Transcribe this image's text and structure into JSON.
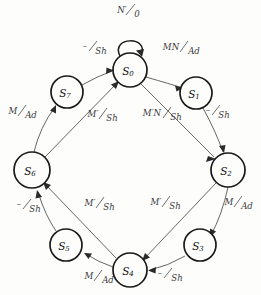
{
  "diagram": {
    "type": "state-transition-diagram",
    "states": [
      {
        "id": "S0",
        "label": "S",
        "subscript": "0",
        "cx": 130,
        "cy": 70,
        "r": 17
      },
      {
        "id": "S1",
        "label": "S",
        "subscript": "1",
        "cx": 196,
        "cy": 93,
        "r": 16
      },
      {
        "id": "S2",
        "label": "S",
        "subscript": "2",
        "cx": 228,
        "cy": 170,
        "r": 17
      },
      {
        "id": "S3",
        "label": "S",
        "subscript": "3",
        "cx": 200,
        "cy": 245,
        "r": 16
      },
      {
        "id": "S4",
        "label": "S",
        "subscript": "4",
        "cx": 130,
        "cy": 270,
        "r": 17
      },
      {
        "id": "S5",
        "label": "S",
        "subscript": "5",
        "cx": 66,
        "cy": 245,
        "r": 16
      },
      {
        "id": "S6",
        "label": "S",
        "subscript": "6",
        "cx": 32,
        "cy": 170,
        "r": 18
      },
      {
        "id": "S7",
        "label": "S",
        "subscript": "7",
        "cx": 67,
        "cy": 92,
        "r": 16
      }
    ],
    "transitions": [
      {
        "id": "t-s0-s0",
        "from": "S0",
        "to": "S0",
        "input": "N′",
        "output": "0",
        "kind": "self-loop",
        "label_x": 127,
        "label_y": 16
      },
      {
        "id": "t-s0-s1",
        "from": "S0",
        "to": "S1",
        "input": "MN",
        "output": "Ad",
        "kind": "ring-arc",
        "label_x": 178,
        "label_y": 55
      },
      {
        "id": "t-s1-s2",
        "from": "S1",
        "to": "S2",
        "input": "–",
        "output": "Sh",
        "kind": "ring-arc",
        "label_x": 215,
        "label_y": 118
      },
      {
        "id": "t-s2-s3",
        "from": "S2",
        "to": "S3",
        "input": "M",
        "output": "Ad",
        "kind": "ring-arc",
        "label_x": 236,
        "label_y": 209
      },
      {
        "id": "t-s3-s4",
        "from": "S3",
        "to": "S4",
        "input": "–",
        "output": "Sh",
        "kind": "ring-arc",
        "label_x": 167,
        "label_y": 272
      },
      {
        "id": "t-s4-s5",
        "from": "S4",
        "to": "S5",
        "input": "M",
        "output": "Ad",
        "kind": "ring-arc",
        "label_x": 96,
        "label_y": 274
      },
      {
        "id": "t-s5-s6",
        "from": "S5",
        "to": "S6",
        "input": "–",
        "output": "Sh",
        "kind": "ring-arc",
        "label_x": 25,
        "label_y": 211
      },
      {
        "id": "t-s6-s7",
        "from": "S6",
        "to": "S7",
        "input": "M",
        "output": "Ad",
        "kind": "ring-arc",
        "label_x": 20,
        "label_y": 118
      },
      {
        "id": "t-s7-s0",
        "from": "S7",
        "to": "S0",
        "input": "–",
        "output": "Sh",
        "kind": "ring-arc",
        "label_x": 92,
        "label_y": 54
      },
      {
        "id": "t-s0-s2",
        "from": "S0",
        "to": "S2",
        "input": "M′N",
        "output": "Sh",
        "kind": "chord",
        "label_x": 161,
        "label_y": 120
      },
      {
        "id": "t-s2-s4",
        "from": "S2",
        "to": "S4",
        "input": "M′",
        "output": "Sh",
        "kind": "chord",
        "label_x": 160,
        "label_y": 209
      },
      {
        "id": "t-s4-s6",
        "from": "S4",
        "to": "S6",
        "input": "M′",
        "output": "Sh",
        "kind": "chord",
        "label_x": 94,
        "label_y": 210
      },
      {
        "id": "t-s6-s0",
        "from": "S6",
        "to": "S0",
        "input": "M′",
        "output": "Sh",
        "kind": "chord",
        "label_x": 97,
        "label_y": 121
      }
    ]
  },
  "colors": {
    "background": "#fdfdfc",
    "node_stroke": "#1a1a1a",
    "edge_stroke": "#4a4a4a",
    "text": "#111111",
    "label_text": "#3a3a3a"
  }
}
